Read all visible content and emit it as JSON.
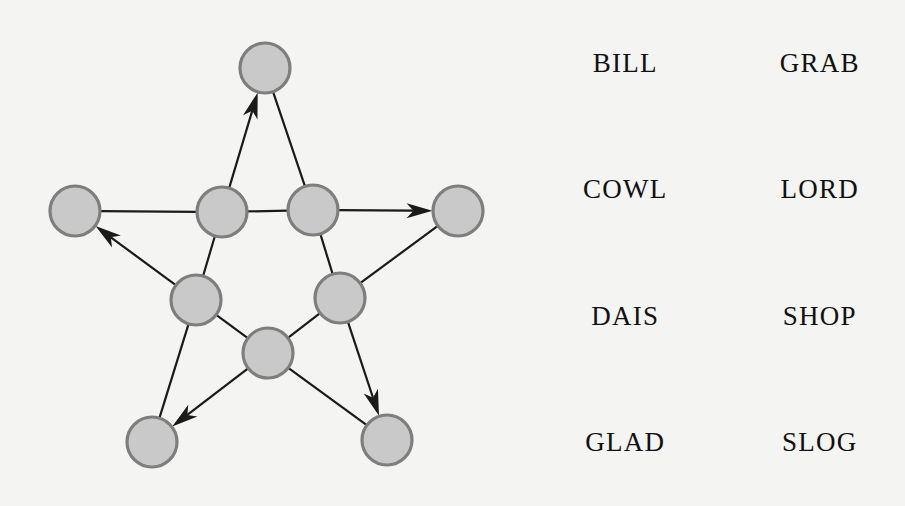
{
  "figure": {
    "title": "",
    "background_color": "#f4f4f2"
  },
  "graph": {
    "label": "star-graph-diagram",
    "node_fill_color": "#c9c9c9",
    "node_stroke_color": "#7e7e7e",
    "edge_color": "#1a1a1a",
    "node_radius": 25,
    "node_count": 10,
    "edge_count": 10,
    "nodes": [
      {
        "id": "outer-top",
        "label": "",
        "x": 265,
        "y": 68,
        "r": 25,
        "ring": "outer"
      },
      {
        "id": "outer-left",
        "label": "",
        "x": 75,
        "y": 211,
        "r": 25,
        "ring": "outer"
      },
      {
        "id": "outer-right",
        "label": "",
        "x": 458,
        "y": 211,
        "r": 25,
        "ring": "outer"
      },
      {
        "id": "outer-bottom-left",
        "label": "",
        "x": 152,
        "y": 442,
        "r": 25,
        "ring": "outer"
      },
      {
        "id": "outer-bottom-right",
        "label": "",
        "x": 387,
        "y": 440,
        "r": 25,
        "ring": "outer"
      },
      {
        "id": "inner-upper-left",
        "label": "",
        "x": 222,
        "y": 212,
        "r": 25,
        "ring": "inner"
      },
      {
        "id": "inner-upper-right",
        "label": "",
        "x": 313,
        "y": 210,
        "r": 25,
        "ring": "inner"
      },
      {
        "id": "inner-lower-left",
        "label": "",
        "x": 196,
        "y": 300,
        "r": 25,
        "ring": "inner"
      },
      {
        "id": "inner-lower-right",
        "label": "",
        "x": 340,
        "y": 298,
        "r": 25,
        "ring": "inner"
      },
      {
        "id": "inner-bottom",
        "label": "",
        "x": 268,
        "y": 353,
        "r": 25,
        "ring": "inner"
      }
    ],
    "edges": [
      {
        "id": "e1",
        "from": "inner-upper-left",
        "to": "outer-top",
        "directed": true
      },
      {
        "id": "e2",
        "from": "outer-top",
        "to": "inner-upper-right",
        "directed": false
      },
      {
        "id": "e3",
        "from": "outer-left",
        "to": "inner-upper-left",
        "directed": false
      },
      {
        "id": "e4",
        "from": "inner-upper-left",
        "to": "inner-upper-right",
        "directed": false
      },
      {
        "id": "e5",
        "from": "inner-upper-right",
        "to": "outer-right",
        "directed": true
      },
      {
        "id": "e6",
        "from": "inner-lower-left",
        "to": "outer-left",
        "directed": true
      },
      {
        "id": "e7",
        "from": "inner-upper-left",
        "to": "inner-lower-left",
        "directed": false
      },
      {
        "id": "e8",
        "from": "inner-upper-right",
        "to": "inner-lower-right",
        "directed": false
      },
      {
        "id": "e9",
        "from": "inner-lower-right",
        "to": "outer-right",
        "directed": false
      },
      {
        "id": "e10",
        "from": "inner-lower-left",
        "to": "outer-bottom-left",
        "directed": false
      },
      {
        "id": "e11",
        "from": "inner-bottom",
        "to": "outer-bottom-left",
        "directed": true
      },
      {
        "id": "e12",
        "from": "inner-lower-left",
        "to": "inner-bottom",
        "directed": false
      },
      {
        "id": "e13",
        "from": "inner-bottom",
        "to": "inner-lower-right",
        "directed": false
      },
      {
        "id": "e14",
        "from": "inner-lower-right",
        "to": "outer-bottom-right",
        "directed": true
      },
      {
        "id": "e15",
        "from": "inner-bottom",
        "to": "outer-bottom-right",
        "directed": false
      }
    ]
  },
  "words": {
    "label": "word-list",
    "rows": [
      {
        "left": "BILL",
        "right": "GRAB"
      },
      {
        "left": "COWL",
        "right": "LORD"
      },
      {
        "left": "DAIS",
        "right": "SHOP"
      },
      {
        "left": "GLAD",
        "right": "SLOG"
      }
    ]
  }
}
